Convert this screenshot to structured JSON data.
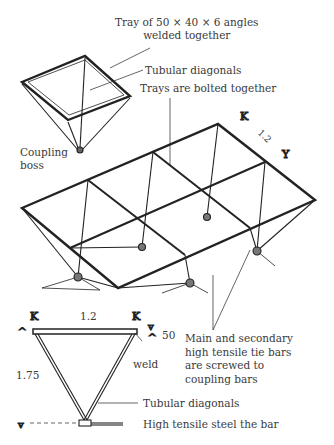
{
  "figure": {
    "labels": {
      "tray": [
        "Tray of 50 × 40 × 6 angles",
        "welded together"
      ],
      "tubular_diagonals_top": "Tubular diagonals",
      "trays_bolted": "Trays are bolted together",
      "coupling_boss": [
        "Coupling",
        "boss"
      ],
      "dim_iso": "1.2",
      "dim_width": "1.2",
      "dim_depth": "50",
      "dim_height": "1.75",
      "weld": "weld",
      "tie_bars": [
        "Main and secondary",
        "high tensile tie bars",
        "are screwed to",
        "coupling bars"
      ],
      "tubular_diagonals_bottom": "Tubular diagonals",
      "steel_bar": "High tensile steel the bar"
    }
  }
}
